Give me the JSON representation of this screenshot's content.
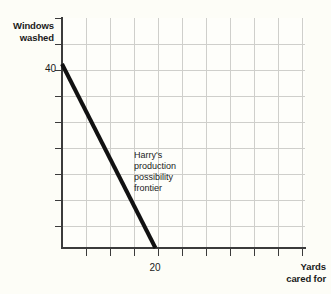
{
  "chart_data": {
    "type": "line",
    "title": "",
    "subtitle": "",
    "xlabel": "Yards cared for",
    "ylabel": "Windows washed",
    "xlabel_lines": [
      "Yards",
      "cared for"
    ],
    "ylabel_lines": [
      "Windows",
      "washed"
    ],
    "xlim": [
      0,
      52
    ],
    "ylim": [
      0,
      50
    ],
    "xticks": [
      0,
      20
    ],
    "yticks": [
      0,
      40
    ],
    "xtick_labels": [
      "",
      "20"
    ],
    "ytick_labels": [
      "",
      "40"
    ],
    "grid": true,
    "grid_color": "#cfcfcb",
    "grid_columns": 10,
    "grid_rows": 9,
    "legend": "none",
    "series": [
      {
        "name": "Harry's production possibility frontier",
        "color": "#111111",
        "linewidth": 4,
        "x": [
          0,
          20
        ],
        "y": [
          40,
          0
        ]
      }
    ],
    "annotations": [
      {
        "name": "ppf-annotation",
        "lines": [
          "Harry's",
          "production",
          "possibility",
          "frontier"
        ],
        "x": 15,
        "y": 21
      }
    ]
  },
  "axis": {
    "y_title_line1": "Windows",
    "y_title_line2": "washed",
    "x_title_line1": "Yards",
    "x_title_line2": "cared for",
    "y_tick_40": "40",
    "x_tick_20": "20"
  },
  "annotation": {
    "line1": "Harry's",
    "line2": "production",
    "line3": "possibility",
    "line4": "frontier"
  },
  "colors": {
    "background": "#fdfdf7",
    "plot_background": "#fefefa",
    "grid": "#cfcfcb",
    "axis": "#3b3b3b",
    "series": "#111111",
    "text": "#1a1a1a"
  }
}
